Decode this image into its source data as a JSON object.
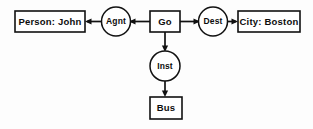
{
  "diagram": {
    "type": "semantic-network",
    "background_color": "#fdfdfd",
    "stroke_color": "#111111",
    "nodes": {
      "person": {
        "label": "Person: John",
        "shape": "box"
      },
      "agent_role": {
        "label": "Agnt",
        "shape": "circle"
      },
      "action": {
        "label": "Go",
        "shape": "box"
      },
      "dest_role": {
        "label": "Dest",
        "shape": "circle"
      },
      "city": {
        "label": "City: Boston",
        "shape": "box"
      },
      "inst_role": {
        "label": "Inst",
        "shape": "circle"
      },
      "instrument": {
        "label": "Bus",
        "shape": "box"
      }
    },
    "edges": [
      {
        "from": "agent_role",
        "to": "person",
        "direction": "left"
      },
      {
        "from": "action",
        "to": "agent_role",
        "direction": "left"
      },
      {
        "from": "action",
        "to": "dest_role",
        "direction": "right"
      },
      {
        "from": "dest_role",
        "to": "city",
        "direction": "right"
      },
      {
        "from": "action",
        "to": "inst_role",
        "direction": "down"
      },
      {
        "from": "inst_role",
        "to": "instrument",
        "direction": "down"
      }
    ]
  }
}
